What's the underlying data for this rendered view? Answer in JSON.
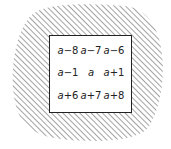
{
  "diagram": {
    "colors": {
      "background": "#ffffff",
      "hatch": "#555555",
      "square_fill": "#ffffff",
      "square_border": "#222222",
      "text": "#222222"
    },
    "grid": {
      "rows": [
        [
          {
            "var": "a",
            "op": "−8"
          },
          {
            "var": "a",
            "op": "−7"
          },
          {
            "var": "a",
            "op": "−6"
          }
        ],
        [
          {
            "var": "a",
            "op": "−1"
          },
          {
            "var": "a",
            "op": ""
          },
          {
            "var": "a",
            "op": "+1"
          }
        ],
        [
          {
            "var": "a",
            "op": "+6"
          },
          {
            "var": "a",
            "op": "+7"
          },
          {
            "var": "a",
            "op": "+8"
          }
        ]
      ]
    }
  }
}
